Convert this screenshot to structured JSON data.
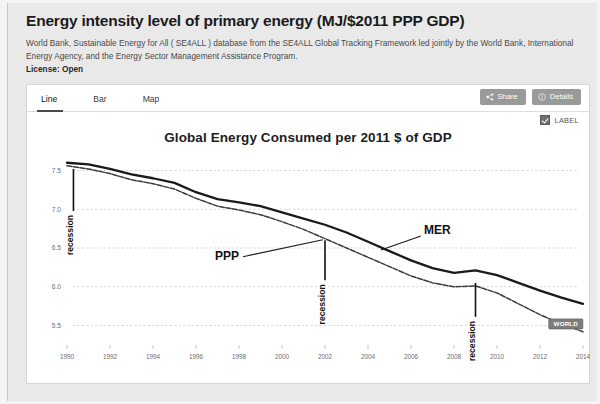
{
  "header": {
    "title": "Energy intensity level of primary energy (MJ/$2011 PPP GDP)",
    "subtitle": "World Bank, Sustainable Energy for All ( SE4ALL ) database from the SE4ALL Global Tracking Framework led jointly by the World Bank, International Energy Agency, and the Energy Sector Management Assistance Program.",
    "license_label": "License:",
    "license_value": "Open"
  },
  "tabs": [
    {
      "label": "Line",
      "active": true
    },
    {
      "label": "Bar",
      "active": false
    },
    {
      "label": "Map",
      "active": false
    }
  ],
  "actions": {
    "share_label": "Share",
    "share_icon": "share-icon",
    "details_label": "Details",
    "details_icon": "info-circle-icon"
  },
  "label_toggle": {
    "label": "LABEL",
    "checked": true
  },
  "colors": {
    "page_bg": "#e9e9e9",
    "card_bg": "#ffffff",
    "button_bg": "#9a9a9a",
    "line_mer": "#1a1a1a",
    "line_ppp": "#3a3a3a",
    "grid": "#cccccc",
    "badge_bg": "#7d7d7d",
    "tab_underline": "#4a4a4a"
  },
  "chart_data": {
    "type": "line",
    "title": "Global Energy Consumed per 2011 $ of GDP",
    "xlabel": "",
    "ylabel": "",
    "xlim": [
      1990,
      2014
    ],
    "ylim": [
      5.3,
      7.7
    ],
    "grid": true,
    "legend": "inline-annotations",
    "y_ticks": [
      "7.5",
      "7.0",
      "6.5",
      "6.0",
      "5.5"
    ],
    "y_tick_values": [
      7.5,
      7.0,
      6.5,
      6.0,
      5.5
    ],
    "x_ticks": [
      "1990",
      "1992",
      "1994",
      "1996",
      "1998",
      "2000",
      "2002",
      "2004",
      "2006",
      "2008",
      "2010",
      "2012",
      "2014"
    ],
    "x": [
      1990,
      1991,
      1992,
      1993,
      1994,
      1995,
      1996,
      1997,
      1998,
      1999,
      2000,
      2001,
      2002,
      2003,
      2004,
      2005,
      2006,
      2007,
      2008,
      2009,
      2010,
      2011,
      2012,
      2013,
      2014
    ],
    "series": [
      {
        "name": "MER",
        "label": "MER",
        "values": [
          7.6,
          7.58,
          7.52,
          7.45,
          7.4,
          7.34,
          7.22,
          7.13,
          7.09,
          7.04,
          6.96,
          6.88,
          6.8,
          6.7,
          6.58,
          6.46,
          6.34,
          6.24,
          6.18,
          6.21,
          6.15,
          6.05,
          5.95,
          5.86,
          5.78
        ]
      },
      {
        "name": "PPP",
        "label": "PPP",
        "values": [
          7.56,
          7.52,
          7.46,
          7.38,
          7.33,
          7.26,
          7.14,
          7.04,
          6.99,
          6.93,
          6.84,
          6.74,
          6.62,
          6.5,
          6.38,
          6.26,
          6.14,
          6.05,
          6.0,
          6.01,
          5.92,
          5.78,
          5.64,
          5.52,
          5.42
        ]
      }
    ],
    "annotations": [
      {
        "text": "recession",
        "x_year": 1990.3,
        "kind": "recession-marker"
      },
      {
        "text": "recession",
        "x_year": 2002.0,
        "kind": "recession-marker"
      },
      {
        "text": "recession",
        "x_year": 2009.0,
        "kind": "recession-marker"
      }
    ],
    "end_badge": {
      "text": "WORLD",
      "series": "PPP",
      "x_year": 2013.2
    }
  }
}
